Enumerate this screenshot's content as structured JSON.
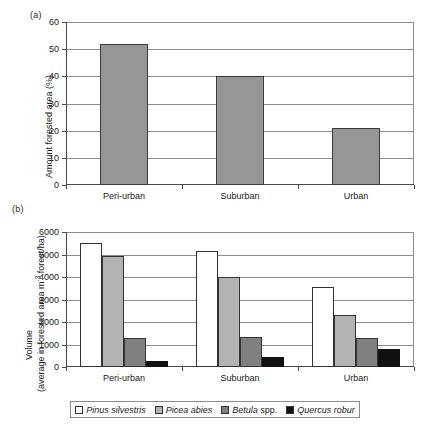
{
  "figure": {
    "panel_a_label": "(a)",
    "panel_b_label": "(b)"
  },
  "chart_data": [
    {
      "type": "bar",
      "panel": "(a)",
      "title": "",
      "xlabel": "",
      "ylabel": "Amount forested area (%)",
      "categories": [
        "Peri-urban",
        "Suburban",
        "Urban"
      ],
      "values": [
        52,
        40,
        21
      ],
      "ylim": [
        0,
        60
      ],
      "ytick_labels": [
        "0",
        "10",
        "20",
        "30",
        "40",
        "50",
        "60"
      ],
      "ytick_values": [
        0,
        10,
        20,
        30,
        40,
        50,
        60
      ],
      "grid": true,
      "legend": "none",
      "bar_color": "#969696",
      "bar_edge_color": "#3c3c3c"
    },
    {
      "type": "bar",
      "panel": "(b)",
      "title": "",
      "xlabel": "",
      "ylabel_line1": "Volume",
      "ylabel_line2_pre": "(average in forested area m",
      "ylabel_line2_sup": "-3",
      "ylabel_line2_post": " forest/ha)",
      "categories": [
        "Peri-urban",
        "Suburban",
        "Urban"
      ],
      "series": [
        {
          "name": "Pinus silvestris",
          "values": [
            5500,
            5150,
            3550
          ],
          "color": "#ffffff",
          "edge": "#333333"
        },
        {
          "name": "Picea abies",
          "values": [
            4950,
            4000,
            2300
          ],
          "color": "#b3b3b3",
          "edge": "#333333"
        },
        {
          "name": "Betula spp.",
          "values": [
            1300,
            1350,
            1300
          ],
          "color": "#808080",
          "edge": "#333333"
        },
        {
          "name": "Quercus robur",
          "values": [
            280,
            450,
            800
          ],
          "color": "#111111",
          "edge": "#111111"
        }
      ],
      "ylim": [
        0,
        6000
      ],
      "ytick_labels": [
        "0",
        "1000",
        "2000",
        "3000",
        "4000",
        "5000",
        "6000"
      ],
      "ytick_values": [
        0,
        1000,
        2000,
        3000,
        4000,
        5000,
        6000
      ],
      "grid": true,
      "legend_position": "bottom"
    }
  ],
  "chart_a": {
    "ylabel": "Amount forested area (%)",
    "yticks": [
      "60",
      "50",
      "40",
      "30",
      "20",
      "10",
      "0"
    ],
    "categories": [
      "Peri-urban",
      "Suburban",
      "Urban"
    ]
  },
  "chart_b": {
    "ylabel_line1": "Volume",
    "ylabel_line2_pre": "(average in forested area m",
    "ylabel_line2_sup": "-3",
    "ylabel_line2_post": " forest/ha)",
    "yticks": [
      "6000",
      "5000",
      "4000",
      "3000",
      "2000",
      "1000",
      "0"
    ],
    "categories": [
      "Peri-urban",
      "Suburban",
      "Urban"
    ]
  },
  "legend": {
    "items": [
      {
        "label_italic": "Pinus silvestris",
        "label_roman": "",
        "swatch": "#ffffff"
      },
      {
        "label_italic": "Picea abies",
        "label_roman": "",
        "swatch": "#b3b3b3"
      },
      {
        "label_italic": "Betula ",
        "label_roman": "spp.",
        "swatch": "#808080"
      },
      {
        "label_italic": "Quercus robur",
        "label_roman": "",
        "swatch": "#111111"
      }
    ]
  }
}
